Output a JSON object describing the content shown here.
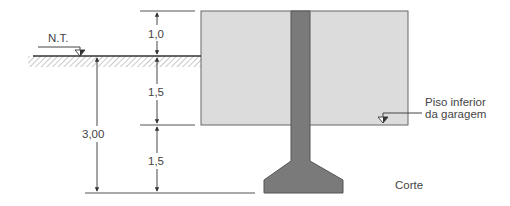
{
  "diagram": {
    "type": "foundation-section",
    "labels": {
      "ground_level": "N.T.",
      "dim_top": "1,0",
      "dim_middle": "1,5",
      "dim_bottom": "1,5",
      "dim_total": "3,00",
      "floor_label_line1": "Piso inferior",
      "floor_label_line2": "da garagem",
      "section_label": "Corte"
    },
    "colors": {
      "soil_fill": "#dcdcdc",
      "column_fill": "#7a7a7a",
      "line": "#444444",
      "hatch": "#777777"
    }
  }
}
